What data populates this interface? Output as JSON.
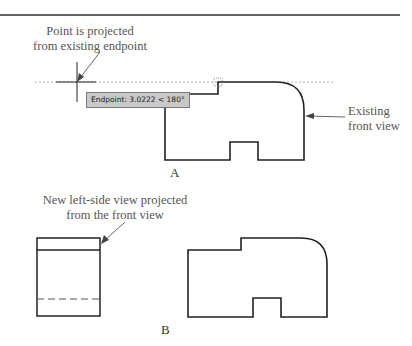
{
  "figure": {
    "panel_a": {
      "label": "A",
      "callout_top": "Point is projected\nfrom existing endpoint",
      "callout_top_line1": "Point is projected",
      "callout_top_line2": "from existing endpoint",
      "callout_right_line1": "Existing",
      "callout_right_line2": "front view",
      "tooltip": "Endpoint: 3.0222 < 180°"
    },
    "panel_b": {
      "label": "B",
      "callout_line1": "New left-side view projected",
      "callout_line2": "from the front view"
    },
    "colors": {
      "line": "#222222",
      "text": "#555555",
      "tracking": "#999999",
      "tooltip_bg": "#c8c8c8"
    }
  }
}
